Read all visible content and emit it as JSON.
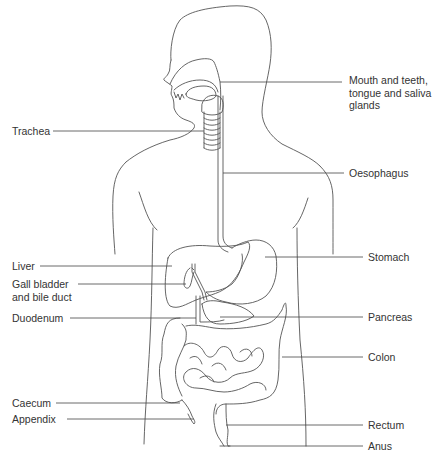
{
  "diagram": {
    "line_color": "#555555",
    "text_color": "#333333",
    "background": "#ffffff",
    "labels": {
      "mouth": {
        "lines": [
          "Mouth and teeth,",
          "tongue and saliva",
          "glands"
        ]
      },
      "trachea": {
        "text": "Trachea"
      },
      "oesophagus": {
        "text": "Oesophagus"
      },
      "liver": {
        "text": "Liver"
      },
      "stomach": {
        "text": "Stomach"
      },
      "gall_bladder": {
        "lines": [
          "Gall bladder",
          "and bile duct"
        ]
      },
      "duodenum": {
        "text": "Duodenum"
      },
      "pancreas": {
        "text": "Pancreas"
      },
      "colon": {
        "text": "Colon"
      },
      "caecum": {
        "text": "Caecum"
      },
      "appendix": {
        "text": "Appendix"
      },
      "rectum": {
        "text": "Rectum"
      },
      "anus": {
        "text": "Anus"
      }
    }
  }
}
